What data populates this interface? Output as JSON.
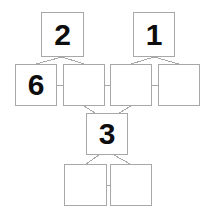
{
  "diagram": {
    "type": "number-box-hierarchy",
    "background_color": "#ffffff",
    "box_border_color": "#a8a8a8",
    "connector_color": "#a8a8a8",
    "text_color": "#0d0d0d",
    "filled_values": [
      "2",
      "1",
      "6",
      "3"
    ],
    "rows": [
      {
        "row_name": "top-row",
        "nodes": [
          {
            "id": "node-top-left",
            "value": "2",
            "filled": true,
            "x": 41,
            "y": 12,
            "w": 43,
            "h": 45
          },
          {
            "id": "node-top-right",
            "value": "1",
            "filled": true,
            "x": 133,
            "y": 12,
            "w": 42,
            "h": 45
          }
        ]
      },
      {
        "row_name": "middle-row",
        "nodes": [
          {
            "id": "node-mid-1",
            "value": "6",
            "filled": true,
            "x": 15,
            "y": 64,
            "w": 42,
            "h": 42
          },
          {
            "id": "node-mid-2",
            "value": "",
            "filled": false,
            "x": 63,
            "y": 64,
            "w": 42,
            "h": 42
          },
          {
            "id": "node-mid-3",
            "value": "",
            "filled": false,
            "x": 110,
            "y": 64,
            "w": 42,
            "h": 42
          },
          {
            "id": "node-mid-4",
            "value": "",
            "filled": false,
            "x": 158,
            "y": 64,
            "w": 42,
            "h": 42
          }
        ]
      },
      {
        "row_name": "center-row",
        "nodes": [
          {
            "id": "node-center",
            "value": "3",
            "filled": true,
            "x": 86,
            "y": 113,
            "w": 42,
            "h": 42
          }
        ]
      },
      {
        "row_name": "bottom-row",
        "nodes": [
          {
            "id": "node-bottom-left",
            "value": "",
            "filled": false,
            "x": 64,
            "y": 164,
            "w": 43,
            "h": 42
          },
          {
            "id": "node-bottom-right",
            "value": "",
            "filled": false,
            "x": 110,
            "y": 164,
            "w": 42,
            "h": 42
          }
        ]
      }
    ],
    "connectors": [
      {
        "name": "connector-top-left-to-mid-1",
        "kind": "diagonal",
        "x1": 62,
        "y1": 57,
        "x2": 36,
        "y2": 64
      },
      {
        "name": "connector-top-left-to-mid-2",
        "kind": "diagonal",
        "x1": 62,
        "y1": 57,
        "x2": 84,
        "y2": 64
      },
      {
        "name": "connector-top-right-to-mid-3",
        "kind": "diagonal",
        "x1": 154,
        "y1": 57,
        "x2": 131,
        "y2": 64
      },
      {
        "name": "connector-top-right-to-mid-4",
        "kind": "diagonal",
        "x1": 154,
        "y1": 57,
        "x2": 179,
        "y2": 64
      },
      {
        "name": "connector-mid-1-to-mid-2",
        "kind": "horizontal",
        "x1": 57,
        "y1": 85,
        "x2": 63,
        "y2": 85
      },
      {
        "name": "connector-mid-2-to-mid-3",
        "kind": "horizontal",
        "x1": 105,
        "y1": 85,
        "x2": 110,
        "y2": 85
      },
      {
        "name": "connector-mid-3-to-mid-4",
        "kind": "horizontal",
        "x1": 152,
        "y1": 85,
        "x2": 158,
        "y2": 85
      },
      {
        "name": "connector-mid-2-to-center",
        "kind": "diagonal",
        "x1": 84,
        "y1": 106,
        "x2": 95,
        "y2": 113
      },
      {
        "name": "connector-mid-3-to-center",
        "kind": "diagonal",
        "x1": 131,
        "y1": 106,
        "x2": 119,
        "y2": 113
      },
      {
        "name": "connector-center-to-bottom-left",
        "kind": "diagonal",
        "x1": 99,
        "y1": 155,
        "x2": 86,
        "y2": 164
      },
      {
        "name": "connector-center-to-bottom-right",
        "kind": "diagonal",
        "x1": 114,
        "y1": 155,
        "x2": 130,
        "y2": 164
      },
      {
        "name": "connector-bottom-left-to-right",
        "kind": "horizontal",
        "x1": 107,
        "y1": 185,
        "x2": 111,
        "y2": 185
      }
    ]
  }
}
